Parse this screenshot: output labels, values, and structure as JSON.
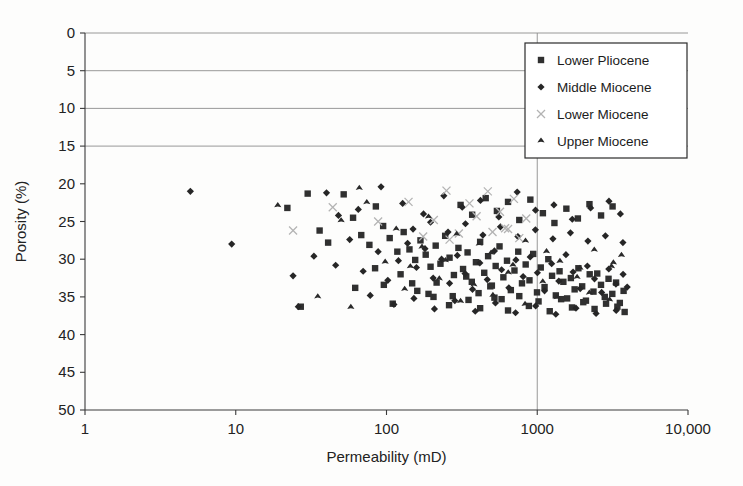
{
  "figure": {
    "background": "#fdfdfc",
    "ink": "#222222"
  },
  "chart_data": {
    "type": "scatter",
    "title": "",
    "xlabel": "Permeability (mD)",
    "ylabel": "Porosity (%)",
    "xscale": "log",
    "yscale": "linear",
    "xlim": [
      1,
      10000
    ],
    "ylim": [
      0,
      50
    ],
    "y_inverted": true,
    "xticks": [
      1,
      10,
      100,
      1000,
      10000
    ],
    "xtick_labels": [
      "1",
      "10",
      "100",
      "1000",
      "10,000"
    ],
    "yticks": [
      0,
      5,
      10,
      15,
      20,
      25,
      30,
      35,
      40,
      45,
      50
    ],
    "ytick_labels": [
      "0",
      "5",
      "10",
      "15",
      "20",
      "25",
      "30",
      "35",
      "40",
      "45",
      "50"
    ],
    "grid": {
      "horizontal_at": [
        0,
        5,
        10,
        15
      ],
      "vertical_at": [
        1000
      ],
      "color": "#8d8d8d"
    },
    "legend": {
      "position": "top-right",
      "entries": [
        {
          "name": "Lower  Pliocene",
          "marker": "square",
          "color": "#303030",
          "size": 3.2
        },
        {
          "name": "Middle Miocene",
          "marker": "diamond",
          "color": "#262626",
          "size": 3.6
        },
        {
          "name": "Lower  Miocene",
          "marker": "cross",
          "color": "#b3b3b3",
          "size": 4.0
        },
        {
          "name": "Upper Miocene",
          "marker": "star",
          "color": "#2a2a2a",
          "size": 3.6
        }
      ]
    },
    "series": [
      {
        "name": "Lower  Pliocene",
        "marker": "square",
        "color": "#303030",
        "points": [
          [
            22,
            23.2
          ],
          [
            30,
            21.3
          ],
          [
            36,
            26.2
          ],
          [
            41,
            27.8
          ],
          [
            52,
            21.4
          ],
          [
            60,
            24.5
          ],
          [
            68,
            26.8
          ],
          [
            77,
            28.1
          ],
          [
            85,
            23.0
          ],
          [
            95,
            25.6
          ],
          [
            105,
            27.2
          ],
          [
            118,
            29.0
          ],
          [
            130,
            26.4
          ],
          [
            142,
            28.7
          ],
          [
            155,
            30.1
          ],
          [
            168,
            27.5
          ],
          [
            182,
            29.4
          ],
          [
            196,
            31.0
          ],
          [
            212,
            28.2
          ],
          [
            228,
            30.6
          ],
          [
            245,
            26.9
          ],
          [
            262,
            29.8
          ],
          [
            280,
            32.1
          ],
          [
            300,
            28.5
          ],
          [
            322,
            31.3
          ],
          [
            345,
            29.1
          ],
          [
            368,
            33.0
          ],
          [
            392,
            30.4
          ],
          [
            418,
            27.7
          ],
          [
            445,
            31.8
          ],
          [
            472,
            29.6
          ],
          [
            500,
            33.5
          ],
          [
            530,
            30.9
          ],
          [
            562,
            28.3
          ],
          [
            596,
            32.4
          ],
          [
            630,
            30.2
          ],
          [
            668,
            34.1
          ],
          [
            706,
            31.5
          ],
          [
            748,
            29.0
          ],
          [
            792,
            33.2
          ],
          [
            838,
            30.7
          ],
          [
            888,
            32.8
          ],
          [
            940,
            29.3
          ],
          [
            996,
            34.4
          ],
          [
            1055,
            31.1
          ],
          [
            1118,
            33.7
          ],
          [
            1184,
            30.0
          ],
          [
            1254,
            32.2
          ],
          [
            1328,
            34.8
          ],
          [
            1406,
            31.6
          ],
          [
            1490,
            33.0
          ],
          [
            1578,
            35.2
          ],
          [
            1671,
            32.5
          ],
          [
            1770,
            34.0
          ],
          [
            1875,
            31.2
          ],
          [
            1986,
            33.6
          ],
          [
            2104,
            35.5
          ],
          [
            2228,
            32.0
          ],
          [
            2360,
            34.3
          ],
          [
            2500,
            31.9
          ],
          [
            2648,
            33.4
          ],
          [
            2805,
            35.0
          ],
          [
            2971,
            32.6
          ],
          [
            3147,
            34.6
          ],
          [
            3333,
            33.1
          ],
          [
            3530,
            35.8
          ],
          [
            3739,
            34.2
          ],
          [
            190,
            34.6
          ],
          [
            260,
            36.1
          ],
          [
            350,
            35.4
          ],
          [
            27,
            36.3
          ],
          [
            62,
            33.8
          ],
          [
            110,
            35.9
          ],
          [
            148,
            33.2
          ],
          [
            205,
            35.0
          ],
          [
            418,
            36.5
          ],
          [
            520,
            35.1
          ],
          [
            640,
            36.8
          ],
          [
            760,
            34.9
          ],
          [
            880,
            36.2
          ],
          [
            1020,
            35.6
          ],
          [
            1210,
            36.9
          ],
          [
            1440,
            35.3
          ],
          [
            1700,
            36.4
          ],
          [
            2020,
            35.7
          ],
          [
            2400,
            36.6
          ],
          [
            2860,
            35.9
          ],
          [
            3400,
            36.3
          ],
          [
            3800,
            37.0
          ],
          [
            310,
            22.8
          ],
          [
            370,
            24.1
          ],
          [
            455,
            21.9
          ],
          [
            540,
            23.6
          ],
          [
            640,
            22.4
          ],
          [
            760,
            24.8
          ],
          [
            900,
            22.1
          ],
          [
            1090,
            23.9
          ],
          [
            1300,
            25.2
          ],
          [
            1560,
            23.3
          ],
          [
            1860,
            24.6
          ],
          [
            2220,
            22.7
          ],
          [
            2650,
            24.2
          ],
          [
            3160,
            23.0
          ],
          [
            84,
            31.2
          ],
          [
            96,
            33.4
          ],
          [
            124,
            32.0
          ],
          [
            160,
            34.2
          ],
          [
            215,
            33.1
          ],
          [
            275,
            34.9
          ],
          [
            338,
            32.3
          ],
          [
            408,
            34.5
          ],
          [
            488,
            33.6
          ],
          [
            580,
            35.3
          ]
        ]
      },
      {
        "name": "Middle Miocene",
        "marker": "diamond",
        "color": "#262626",
        "points": [
          [
            5.0,
            21.0
          ],
          [
            9.4,
            28.0
          ],
          [
            24,
            32.2
          ],
          [
            26,
            36.3
          ],
          [
            33,
            29.6
          ],
          [
            46,
            30.8
          ],
          [
            57,
            27.4
          ],
          [
            70,
            31.6
          ],
          [
            88,
            29.0
          ],
          [
            102,
            32.8
          ],
          [
            120,
            30.2
          ],
          [
            138,
            27.9
          ],
          [
            158,
            31.1
          ],
          [
            180,
            28.6
          ],
          [
            204,
            32.5
          ],
          [
            232,
            30.0
          ],
          [
            262,
            33.2
          ],
          [
            295,
            29.5
          ],
          [
            332,
            31.9
          ],
          [
            372,
            34.0
          ],
          [
            416,
            30.5
          ],
          [
            466,
            32.7
          ],
          [
            520,
            28.9
          ],
          [
            580,
            31.4
          ],
          [
            648,
            33.8
          ],
          [
            722,
            30.1
          ],
          [
            806,
            32.3
          ],
          [
            898,
            29.7
          ],
          [
            1002,
            31.8
          ],
          [
            1118,
            34.2
          ],
          [
            1246,
            30.6
          ],
          [
            1390,
            32.9
          ],
          [
            1550,
            29.4
          ],
          [
            1728,
            31.7
          ],
          [
            1928,
            33.9
          ],
          [
            2150,
            30.9
          ],
          [
            2398,
            32.6
          ],
          [
            2674,
            34.4
          ],
          [
            2982,
            31.3
          ],
          [
            3326,
            33.3
          ],
          [
            3710,
            32.0
          ],
          [
            3950,
            33.7
          ],
          [
            40,
            21.2
          ],
          [
            48,
            24.2
          ],
          [
            65,
            23.4
          ],
          [
            92,
            20.4
          ],
          [
            128,
            22.6
          ],
          [
            176,
            24.0
          ],
          [
            240,
            21.6
          ],
          [
            318,
            23.1
          ],
          [
            420,
            22.2
          ],
          [
            556,
            24.4
          ],
          [
            736,
            21.1
          ],
          [
            974,
            23.5
          ],
          [
            1290,
            22.8
          ],
          [
            1708,
            24.7
          ],
          [
            2260,
            23.2
          ],
          [
            2990,
            22.3
          ],
          [
            3560,
            24.0
          ],
          [
            78,
            34.8
          ],
          [
            112,
            36.0
          ],
          [
            152,
            35.2
          ],
          [
            208,
            36.6
          ],
          [
            284,
            35.5
          ],
          [
            388,
            36.9
          ],
          [
            528,
            35.8
          ],
          [
            718,
            37.1
          ],
          [
            976,
            36.2
          ],
          [
            1328,
            37.3
          ],
          [
            1806,
            36.5
          ],
          [
            2456,
            37.2
          ],
          [
            3340,
            36.8
          ],
          [
            150,
            26.0
          ],
          [
            196,
            25.1
          ],
          [
            256,
            26.4
          ],
          [
            334,
            25.3
          ],
          [
            436,
            26.8
          ],
          [
            570,
            25.7
          ],
          [
            744,
            27.0
          ],
          [
            972,
            26.1
          ],
          [
            1270,
            27.3
          ],
          [
            1660,
            26.5
          ],
          [
            2168,
            27.6
          ],
          [
            2832,
            26.9
          ],
          [
            3700,
            27.8
          ]
        ]
      },
      {
        "name": "Lower  Miocene",
        "marker": "cross",
        "color": "#b3b3b3",
        "points": [
          [
            24,
            26.2
          ],
          [
            44,
            23.1
          ],
          [
            88,
            25.0
          ],
          [
            140,
            22.4
          ],
          [
            206,
            24.8
          ],
          [
            250,
            20.9
          ],
          [
            302,
            26.6
          ],
          [
            396,
            24.3
          ],
          [
            470,
            21.0
          ],
          [
            505,
            26.4
          ],
          [
            566,
            23.7
          ],
          [
            612,
            25.9
          ],
          [
            700,
            22.0
          ],
          [
            760,
            27.2
          ],
          [
            845,
            24.6
          ],
          [
            262,
            27.4
          ],
          [
            175,
            27.0
          ],
          [
            355,
            22.6
          ],
          [
            640,
            26.0
          ]
        ]
      },
      {
        "name": "Upper Miocene",
        "marker": "star",
        "color": "#2a2a2a",
        "points": [
          [
            19,
            22.9
          ],
          [
            35,
            35.0
          ],
          [
            50,
            24.9
          ],
          [
            58,
            36.4
          ],
          [
            74,
            22.5
          ],
          [
            98,
            30.4
          ],
          [
            132,
            34.0
          ],
          [
            172,
            28.4
          ],
          [
            224,
            32.6
          ],
          [
            292,
            26.7
          ],
          [
            380,
            33.4
          ],
          [
            494,
            29.2
          ],
          [
            642,
            31.8
          ],
          [
            836,
            27.6
          ],
          [
            1088,
            33.0
          ],
          [
            1414,
            30.3
          ],
          [
            1838,
            32.4
          ],
          [
            2390,
            28.8
          ],
          [
            3108,
            31.0
          ],
          [
            3620,
            29.5
          ],
          [
            66,
            20.6
          ],
          [
            116,
            26.0
          ],
          [
            190,
            24.4
          ],
          [
            310,
            35.6
          ],
          [
            508,
            34.8
          ],
          [
            830,
            36.0
          ],
          [
            1356,
            35.1
          ],
          [
            2216,
            34.5
          ],
          [
            3020,
            35.4
          ],
          [
            144,
            31.0
          ],
          [
            246,
            30.2
          ],
          [
            412,
            28.0
          ],
          [
            690,
            30.8
          ],
          [
            1152,
            29.0
          ],
          [
            1920,
            31.2
          ],
          [
            3200,
            30.5
          ]
        ]
      }
    ]
  },
  "plot_geometry": {
    "left": 85,
    "right": 688,
    "top": 33,
    "bottom": 410
  },
  "legend_geometry": {
    "x": 525,
    "y": 43,
    "width": 162,
    "height": 115
  }
}
